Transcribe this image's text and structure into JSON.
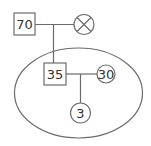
{
  "diagram": {
    "type": "genogram",
    "nodes": [
      {
        "id": "grandfather",
        "shape": "square",
        "label": "70"
      },
      {
        "id": "grandmother",
        "shape": "circle-x",
        "label": "",
        "status": "deceased"
      },
      {
        "id": "father",
        "shape": "square",
        "label": "35"
      },
      {
        "id": "mother",
        "shape": "circle",
        "label": "30"
      },
      {
        "id": "child",
        "shape": "circle",
        "label": "3"
      }
    ],
    "household": {
      "shape": "ellipse",
      "members": [
        "father",
        "mother",
        "child"
      ]
    },
    "colors": {
      "stroke": "#6b6b6b",
      "text": "#333333",
      "background": "#ffffff"
    }
  }
}
